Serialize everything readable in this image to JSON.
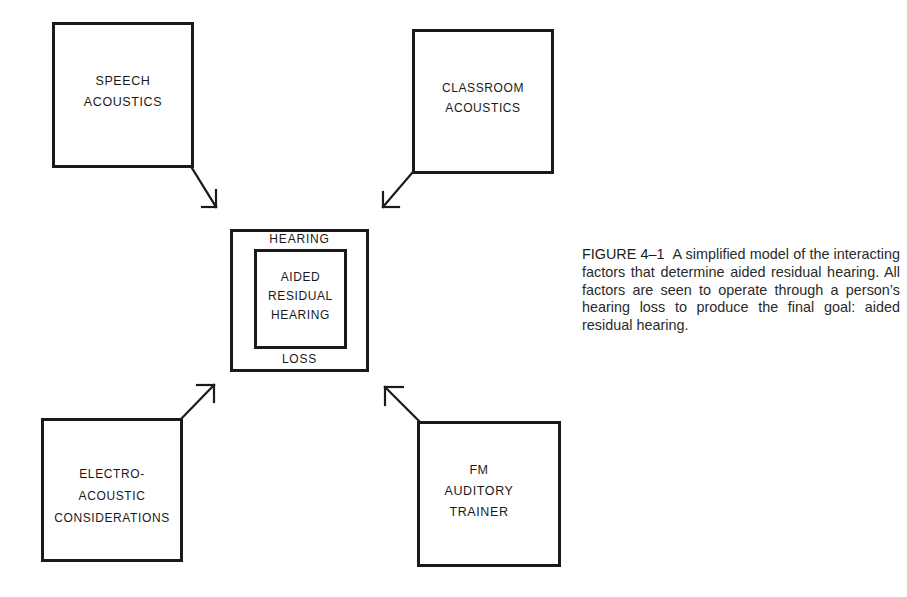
{
  "diagram": {
    "title": "A simplified model of the interacting factors that determine aided residual hearing",
    "factors": [
      {
        "id": "speech",
        "lines": [
          "SPEECH",
          "ACOUSTICS"
        ],
        "position": "top-left"
      },
      {
        "id": "classroom",
        "lines": [
          "CLASSROOM",
          "ACOUSTICS"
        ],
        "position": "top-right"
      },
      {
        "id": "electro",
        "lines": [
          "ELECTRO-",
          "ACOUSTIC",
          "CONSIDERATIONS"
        ],
        "position": "bottom-left"
      },
      {
        "id": "fm",
        "lines": [
          "FM",
          "AUDITORY",
          "TRAINER"
        ],
        "position": "bottom-right"
      }
    ],
    "center": {
      "outer_ring_top": "HEARING",
      "outer_ring_bottom": "LOSS",
      "inner_lines": [
        "AIDED",
        "RESIDUAL",
        "HEARING"
      ]
    },
    "arrows": [
      {
        "from": "speech",
        "to": "center",
        "direction": "down-right"
      },
      {
        "from": "classroom",
        "to": "center",
        "direction": "down-left"
      },
      {
        "from": "electro",
        "to": "center",
        "direction": "up-right"
      },
      {
        "from": "fm",
        "to": "center",
        "direction": "up-left"
      }
    ],
    "stroke_color": "#1a1a1a",
    "background_color": "#ffffff"
  },
  "caption": {
    "figure_label": "FIGURE 4–1",
    "text": "A simplified model of the interacting factors that determine aided residual hearing. All factors are seen to operate through a person’s hearing loss to produce the final goal: aided residual hearing."
  }
}
